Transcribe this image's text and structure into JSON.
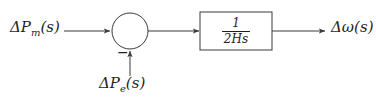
{
  "diagram": {
    "stroke_color": "#3a3a3a",
    "text_color": "#1f1f1f",
    "background_color": "#ffffff",
    "input": {
      "label": "ΔP",
      "subscript": "m",
      "argument": "(s)",
      "full_label": "ΔPm(s)"
    },
    "disturbance": {
      "label": "ΔP",
      "subscript": "e",
      "argument": "(s)",
      "full_label": "ΔPe(s)",
      "sign": "−"
    },
    "output": {
      "label": "Δω",
      "argument": "(s)",
      "full_label": "Δω(s)"
    },
    "transfer_block": {
      "numerator": "1",
      "denominator_coefficient": "2",
      "denominator_inertia": "H",
      "denominator_variable": "s",
      "denominator": "2Hs",
      "expression": "1/(2Hs)"
    },
    "summing_junction": {
      "name": "summing-junction",
      "shape": "circle"
    }
  }
}
